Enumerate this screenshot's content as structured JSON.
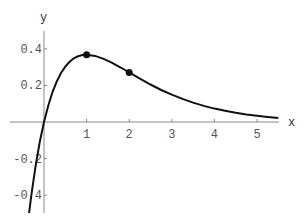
{
  "chart_data": {
    "type": "line",
    "title": "",
    "xlabel": "x",
    "ylabel": "y",
    "function": "y = x*exp(-x)",
    "xlim": [
      -0.35,
      5.5
    ],
    "ylim": [
      -0.5,
      0.5
    ],
    "grid": false,
    "legend": null,
    "x_ticks": [
      1,
      2,
      3,
      4,
      5
    ],
    "x_tick_labels": [
      "1",
      "2",
      "3",
      "4",
      "5"
    ],
    "y_ticks": [
      -0.4,
      -0.2,
      0.2,
      0.4
    ],
    "y_tick_labels": [
      "-0.4",
      "-0.2",
      "0.2",
      "0.4"
    ],
    "series": [
      {
        "name": "curve",
        "x": [
          -0.35,
          -0.3,
          -0.2,
          -0.1,
          0,
          0.1,
          0.2,
          0.3,
          0.4,
          0.5,
          0.6,
          0.7,
          0.8,
          0.9,
          1.0,
          1.2,
          1.4,
          1.6,
          1.8,
          2.0,
          2.25,
          2.5,
          2.75,
          3.0,
          3.25,
          3.5,
          3.75,
          4.0,
          4.25,
          4.5,
          4.75,
          5.0,
          5.25,
          5.5
        ],
        "values": [
          -0.497,
          -0.405,
          -0.244,
          -0.111,
          0,
          0.09,
          0.164,
          0.222,
          0.268,
          0.303,
          0.329,
          0.348,
          0.359,
          0.366,
          0.368,
          0.361,
          0.345,
          0.323,
          0.298,
          0.271,
          0.237,
          0.205,
          0.175,
          0.149,
          0.126,
          0.106,
          0.088,
          0.073,
          0.061,
          0.05,
          0.041,
          0.034,
          0.028,
          0.022
        ]
      }
    ],
    "markers": [
      {
        "x": 1,
        "y": 0.368
      },
      {
        "x": 2,
        "y": 0.271
      }
    ],
    "colors": {
      "curve": "#111111",
      "axes": "#888888",
      "labels": "#555555"
    }
  }
}
